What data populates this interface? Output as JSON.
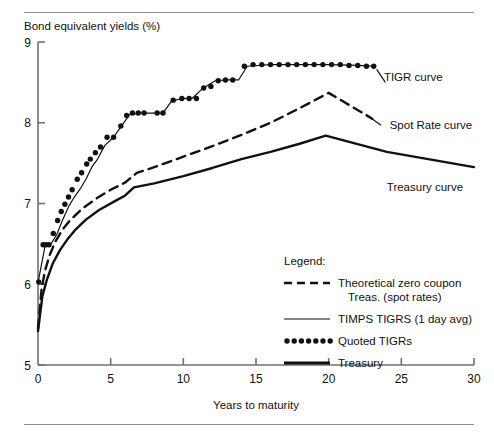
{
  "chart_data": {
    "type": "line",
    "title": "Bond equivalent yields (%)",
    "xlabel": "Years to maturity",
    "ylabel": "Bond equivalent yields (%)",
    "xlim": [
      0,
      30
    ],
    "ylim": [
      5,
      9
    ],
    "xticks": [
      0,
      5,
      10,
      15,
      20,
      25,
      30
    ],
    "yticks": [
      5,
      6,
      7,
      8,
      9
    ],
    "grid": false,
    "legend_position": "inside-lower-right",
    "series": [
      {
        "name": "Theoretical zero coupon Treas. (spot rates)",
        "style": "dashed",
        "points": [
          [
            0.0,
            5.45
          ],
          [
            0.25,
            5.95
          ],
          [
            0.5,
            6.18
          ],
          [
            0.8,
            6.36
          ],
          [
            1.2,
            6.53
          ],
          [
            1.7,
            6.68
          ],
          [
            2.2,
            6.79
          ],
          [
            3.0,
            6.93
          ],
          [
            4.0,
            7.06
          ],
          [
            5.0,
            7.17
          ],
          [
            6.0,
            7.26
          ],
          [
            6.8,
            7.38
          ],
          [
            8.0,
            7.45
          ],
          [
            10.0,
            7.58
          ],
          [
            12.0,
            7.71
          ],
          [
            14.0,
            7.85
          ],
          [
            16.0,
            8.0
          ],
          [
            18.0,
            8.18
          ],
          [
            20.0,
            8.37
          ],
          [
            23.0,
            8.05
          ]
        ]
      },
      {
        "name": "TIMPS TIGRS (1 day avg)",
        "style": "thin-solid",
        "points": [
          [
            0.0,
            6.02
          ],
          [
            0.3,
            6.3
          ],
          [
            0.5,
            6.49
          ],
          [
            0.9,
            6.5
          ],
          [
            1.3,
            6.62
          ],
          [
            1.7,
            6.8
          ],
          [
            2.1,
            6.96
          ],
          [
            2.5,
            7.08
          ],
          [
            2.9,
            7.18
          ],
          [
            3.3,
            7.3
          ],
          [
            3.7,
            7.45
          ],
          [
            4.1,
            7.55
          ],
          [
            4.6,
            7.72
          ],
          [
            5.2,
            7.82
          ],
          [
            5.7,
            7.95
          ],
          [
            6.3,
            8.1
          ],
          [
            7.0,
            8.12
          ],
          [
            8.0,
            8.12
          ],
          [
            8.6,
            8.12
          ],
          [
            9.2,
            8.27
          ],
          [
            10.0,
            8.3
          ],
          [
            10.6,
            8.3
          ],
          [
            11.3,
            8.42
          ],
          [
            12.2,
            8.52
          ],
          [
            13.0,
            8.53
          ],
          [
            13.8,
            8.53
          ],
          [
            14.4,
            8.7
          ],
          [
            16.0,
            8.72
          ],
          [
            18.0,
            8.72
          ],
          [
            20.0,
            8.72
          ],
          [
            22.0,
            8.71
          ],
          [
            23.2,
            8.7
          ]
        ]
      },
      {
        "name": "Quoted TIGRs",
        "style": "dotted-markers",
        "points": [
          [
            0.05,
            6.03
          ],
          [
            0.35,
            6.49
          ],
          [
            0.55,
            6.49
          ],
          [
            0.75,
            6.49
          ],
          [
            1.05,
            6.63
          ],
          [
            1.35,
            6.79
          ],
          [
            1.6,
            6.9
          ],
          [
            1.85,
            6.99
          ],
          [
            2.1,
            7.08
          ],
          [
            2.35,
            7.17
          ],
          [
            2.7,
            7.3
          ],
          [
            3.0,
            7.38
          ],
          [
            3.35,
            7.49
          ],
          [
            3.6,
            7.55
          ],
          [
            3.95,
            7.63
          ],
          [
            4.3,
            7.7
          ],
          [
            4.75,
            7.82
          ],
          [
            5.2,
            7.82
          ],
          [
            5.7,
            7.96
          ],
          [
            6.1,
            8.09
          ],
          [
            6.5,
            8.12
          ],
          [
            6.9,
            8.12
          ],
          [
            7.3,
            8.12
          ],
          [
            8.2,
            8.12
          ],
          [
            8.6,
            8.12
          ],
          [
            9.3,
            8.28
          ],
          [
            9.9,
            8.3
          ],
          [
            10.4,
            8.3
          ],
          [
            10.9,
            8.3
          ],
          [
            11.4,
            8.43
          ],
          [
            11.9,
            8.45
          ],
          [
            12.4,
            8.52
          ],
          [
            12.9,
            8.53
          ],
          [
            13.4,
            8.53
          ],
          [
            14.2,
            8.7
          ],
          [
            14.8,
            8.72
          ],
          [
            15.4,
            8.72
          ],
          [
            16.0,
            8.72
          ],
          [
            16.6,
            8.72
          ],
          [
            17.2,
            8.72
          ],
          [
            17.8,
            8.72
          ],
          [
            18.4,
            8.72
          ],
          [
            19.0,
            8.72
          ],
          [
            19.6,
            8.72
          ],
          [
            20.2,
            8.72
          ],
          [
            20.8,
            8.72
          ],
          [
            21.4,
            8.71
          ],
          [
            22.0,
            8.71
          ],
          [
            22.6,
            8.7
          ],
          [
            23.1,
            8.7
          ]
        ]
      },
      {
        "name": "Treasury",
        "style": "thick-solid",
        "points": [
          [
            0.0,
            5.42
          ],
          [
            0.3,
            5.85
          ],
          [
            0.6,
            6.05
          ],
          [
            1.0,
            6.25
          ],
          [
            1.5,
            6.42
          ],
          [
            2.0,
            6.55
          ],
          [
            2.6,
            6.68
          ],
          [
            3.3,
            6.8
          ],
          [
            4.2,
            6.92
          ],
          [
            5.2,
            7.02
          ],
          [
            6.0,
            7.1
          ],
          [
            6.6,
            7.2
          ],
          [
            8.0,
            7.25
          ],
          [
            10.0,
            7.34
          ],
          [
            12.0,
            7.44
          ],
          [
            14.0,
            7.55
          ],
          [
            16.0,
            7.64
          ],
          [
            18.0,
            7.74
          ],
          [
            19.8,
            7.84
          ],
          [
            24.0,
            7.64
          ],
          [
            30.0,
            7.45
          ]
        ]
      }
    ],
    "annotations": [
      {
        "label": "TIGR curve",
        "x": 23.8,
        "y": 8.52
      },
      {
        "label": "Spot Rate curve",
        "x": 24.2,
        "y": 7.92
      },
      {
        "label": "Treasury curve",
        "x": 24.0,
        "y": 7.15
      }
    ]
  },
  "legend": {
    "title": "Legend:",
    "entries": [
      {
        "swatch": "dashed",
        "label_line1": "Theoretical zero coupon",
        "label_line2": "Treas. (spot rates)"
      },
      {
        "swatch": "thin-solid",
        "label_line1": "TIMPS TIGRS (1 day avg)",
        "label_line2": ""
      },
      {
        "swatch": "dotted",
        "label_line1": "Quoted TIGRs",
        "label_line2": ""
      },
      {
        "swatch": "thick-solid",
        "label_line1": "Treasury",
        "label_line2": ""
      }
    ]
  },
  "colors": {
    "ink": "#111111",
    "rule": "#8d8d8d",
    "axis": "#6f6f6f",
    "background": "#ffffff"
  }
}
